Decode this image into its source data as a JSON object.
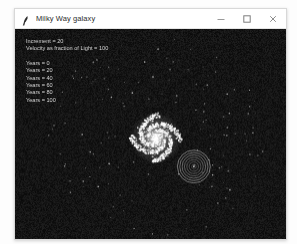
{
  "window": {
    "title": "Milky Way galaxy",
    "icon": "feather-icon",
    "controls": {
      "minimize": "minimize-icon",
      "maximize": "maximize-icon",
      "close": "close-icon"
    }
  },
  "canvas": {
    "background_color": "#0a0a0a",
    "star_color": "#ffffff",
    "ring_color": "#bcbcbc",
    "core_glow_color": "#ffffff"
  },
  "hud": {
    "increment_line": "Increment = 20",
    "velocity_line": "Velocity as fraction of Light =  100",
    "years_lines": [
      "Years =  0",
      "Years =  20",
      "Years =  40",
      "Years =  60",
      "Years =  80",
      "Years =  100"
    ]
  },
  "simulation": {
    "galaxy_center": {
      "x": 0.52,
      "y": 0.52
    },
    "ring_marker_center": {
      "x": 0.66,
      "y": 0.655
    },
    "ring_count": 7,
    "arm_count": 4,
    "star_count": 760
  }
}
